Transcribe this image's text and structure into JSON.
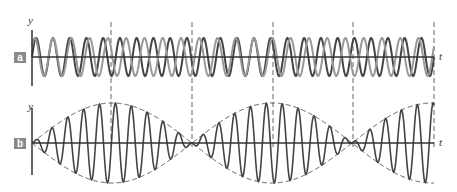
{
  "panels": [
    {
      "label": "a",
      "y_axis": "y",
      "x_axis": "t"
    },
    {
      "label": "b",
      "y_axis": "y",
      "x_axis": "t"
    }
  ],
  "chart_data": [
    {
      "type": "line",
      "title": "Panel a: two waves of slightly different frequency",
      "xlabel": "t",
      "ylabel": "y",
      "series": [
        {
          "name": "wave 1",
          "color": "#444444",
          "frequency_cycles": 24,
          "amplitude": 1
        },
        {
          "name": "wave 2",
          "color": "#999999",
          "frequency_cycles": 22,
          "amplitude": 1
        }
      ],
      "dashed_markers_x": [
        111,
        192,
        273,
        353,
        434
      ]
    },
    {
      "type": "line",
      "title": "Panel b: superposition showing beats",
      "xlabel": "t",
      "ylabel": "y",
      "series": [
        {
          "name": "resultant",
          "color": "#444444",
          "cycles": 23
        },
        {
          "name": "envelope",
          "color": "#555555",
          "style": "dashed",
          "beat_nodes_x": [
            32,
            192,
            353
          ]
        }
      ]
    }
  ],
  "colors": {
    "dark": "#444444",
    "light": "#999999",
    "badge": "#8a8a8a"
  }
}
